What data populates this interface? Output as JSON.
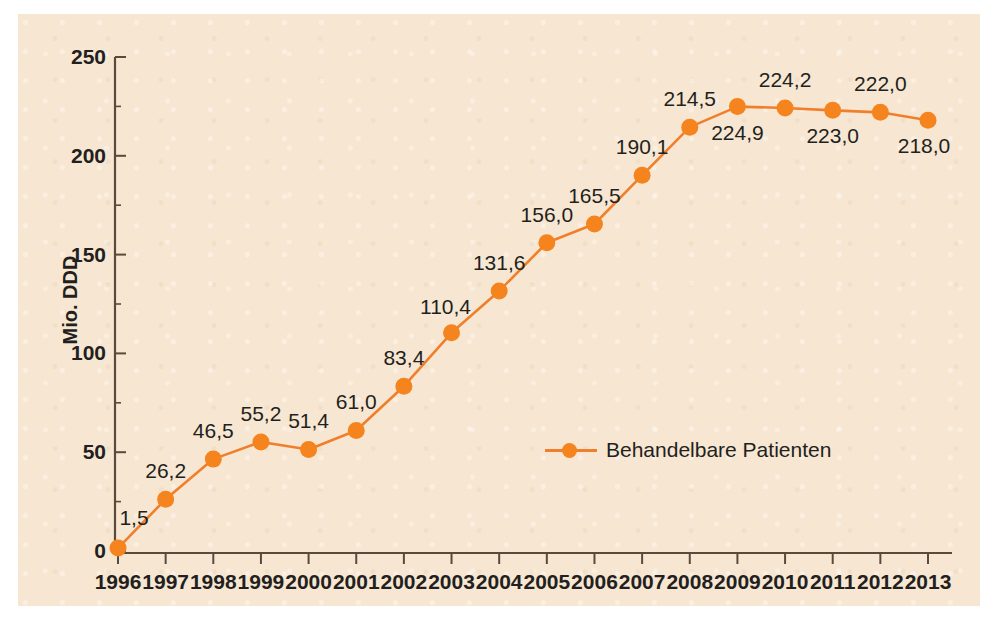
{
  "chart_data": {
    "type": "line",
    "title": "",
    "subtitle": "",
    "xlabel": "",
    "ylabel": "Mio. DDD",
    "categories": [
      "1996",
      "1997",
      "1998",
      "1999",
      "2000",
      "2001",
      "2002",
      "2003",
      "2004",
      "2005",
      "2006",
      "2007",
      "2008",
      "2009",
      "2010",
      "2011",
      "2012",
      "2013"
    ],
    "values": [
      1.5,
      26.2,
      46.5,
      55.2,
      51.4,
      61.0,
      83.4,
      110.4,
      131.6,
      156.0,
      165.5,
      190.1,
      214.5,
      224.9,
      224.2,
      223.0,
      222.0,
      218.0
    ],
    "point_labels": [
      "1,5",
      "26,2",
      "46,5",
      "55,2",
      "51,4",
      "61,0",
      "83,4",
      "110,4",
      "131,6",
      "156,0",
      "165,5",
      "190,1",
      "214,5",
      "224,9",
      "224,2",
      "223,0",
      "222,0",
      "218,0"
    ],
    "label_positions": [
      "below",
      "above",
      "above",
      "above",
      "above",
      "above",
      "above",
      "below",
      "above",
      "above",
      "above",
      "above",
      "above",
      "below",
      "above",
      "below",
      "above",
      "below"
    ],
    "series": [
      {
        "name": "Behandelbare Patienten",
        "values": [
          1.5,
          26.2,
          46.5,
          55.2,
          51.4,
          61.0,
          83.4,
          110.4,
          131.6,
          156.0,
          165.5,
          190.1,
          214.5,
          224.9,
          224.2,
          223.0,
          222.0,
          218.0
        ],
        "color": "#f5841f"
      }
    ],
    "ylim": [
      0,
      250
    ],
    "yticks": [
      0,
      50,
      100,
      150,
      200,
      250
    ],
    "ytick_labels": [
      "0",
      "50",
      "100",
      "150",
      "200",
      "250"
    ],
    "grid": false,
    "legend_position": "inside-bottom-right",
    "legend": [
      "Behandelbare Patienten"
    ],
    "annotations": []
  },
  "legend": {
    "label": "Behandelbare Patienten"
  },
  "axes": {
    "y_title": "Mio. DDD"
  },
  "colors": {
    "accent": "#f5841f",
    "line": "#f07f2b",
    "panel_background": "#f7e7d2",
    "text": "#231f20",
    "axis": "#5a4a3c"
  }
}
